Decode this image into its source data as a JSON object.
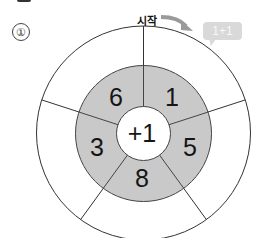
{
  "problem": {
    "number_label": "①"
  },
  "start": {
    "label": "시작",
    "arrow_icon": "curved-arrow-right"
  },
  "bubble": {
    "text": "1+1"
  },
  "wheel": {
    "center_operation": "+1",
    "inner_numbers": [
      "6",
      "1",
      "5",
      "8",
      "3"
    ],
    "outer_answers": [
      "",
      "",
      "",
      "",
      ""
    ],
    "ring_fill_color": "#c9c9c9",
    "arrow_color": "#9a9a9a",
    "bubble_color": "#d9d9d9"
  }
}
